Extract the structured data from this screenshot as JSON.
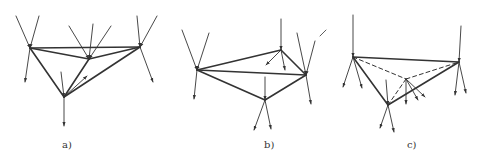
{
  "figure": {
    "stroke_color": "#333333",
    "panels": [
      {
        "id": "a",
        "label": "a)",
        "label_pos": [
          62,
          149
        ],
        "nodes": {
          "A": [
            30,
            48
          ],
          "B": [
            89,
            59
          ],
          "C": [
            140,
            47
          ],
          "D": [
            64,
            97
          ]
        },
        "edges": [
          [
            "A",
            "C"
          ],
          [
            "A",
            "B"
          ],
          [
            "B",
            "C"
          ],
          [
            "A",
            "D"
          ],
          [
            "B",
            "D"
          ],
          [
            "C",
            "D"
          ]
        ],
        "dashed_edges": [],
        "arrows_in": [
          [
            [
              16,
              16
            ],
            [
              30,
              48
            ]
          ],
          [
            [
              39,
              16
            ],
            [
              30,
              48
            ]
          ],
          [
            [
              69,
              26
            ],
            [
              89,
              59
            ]
          ],
          [
            [
              93,
              24
            ],
            [
              89,
              59
            ]
          ],
          [
            [
              111,
              26
            ],
            [
              89,
              59
            ]
          ],
          [
            [
              137,
              16
            ],
            [
              140,
              47
            ]
          ],
          [
            [
              157,
              16
            ],
            [
              140,
              47
            ]
          ],
          [
            [
              61,
              72
            ],
            [
              64,
              97
            ]
          ]
        ],
        "arrows_out": [
          [
            [
              30,
              48
            ],
            [
              25,
              82
            ]
          ],
          [
            [
              140,
              47
            ],
            [
              153,
              82
            ]
          ],
          [
            [
              64,
              97
            ],
            [
              64,
              126
            ]
          ],
          [
            [
              64,
              97
            ],
            [
              87,
              76
            ]
          ]
        ]
      },
      {
        "id": "b",
        "label": "b)",
        "label_pos": [
          264,
          149
        ],
        "nodes": {
          "A": [
            197,
            70
          ],
          "B": [
            281,
            50
          ],
          "C": [
            306,
            75
          ],
          "D": [
            265,
            100
          ]
        },
        "edges": [
          [
            "A",
            "B"
          ],
          [
            "A",
            "C"
          ],
          [
            "B",
            "C"
          ],
          [
            "A",
            "D"
          ],
          [
            "C",
            "D"
          ]
        ],
        "dashed_edges": [],
        "arrows_in": [
          [
            [
              182,
              30
            ],
            [
              197,
              70
            ]
          ],
          [
            [
              209,
              33
            ],
            [
              197,
              70
            ]
          ],
          [
            [
              281,
              19
            ],
            [
              281,
              50
            ]
          ],
          [
            [
              297,
              33
            ],
            [
              306,
              75
            ]
          ],
          [
            [
              315,
              41
            ],
            [
              306,
              75
            ]
          ],
          [
            [
              265,
              77
            ],
            [
              265,
              100
            ]
          ]
        ],
        "arrows_out": [
          [
            [
              197,
              70
            ],
            [
              194,
              99
            ]
          ],
          [
            [
              281,
              50
            ],
            [
              266,
              65
            ]
          ],
          [
            [
              281,
              50
            ],
            [
              285,
              70
            ]
          ],
          [
            [
              306,
              75
            ],
            [
              311,
              104
            ]
          ],
          [
            [
              265,
              100
            ],
            [
              254,
              130
            ]
          ],
          [
            [
              265,
              100
            ],
            [
              271,
              129
            ]
          ]
        ]
      },
      {
        "id": "c",
        "label": "c)",
        "label_pos": [
          407,
          149
        ],
        "nodes": {
          "A": [
            353,
            57
          ],
          "B": [
            459,
            62
          ],
          "C": [
            406,
            79
          ],
          "D": [
            388,
            105
          ]
        },
        "edges": [
          [
            "A",
            "B"
          ],
          [
            "A",
            "D"
          ],
          [
            "B",
            "D"
          ]
        ],
        "dashed_edges": [
          [
            "A",
            "C"
          ],
          [
            "C",
            "B"
          ],
          [
            "C",
            "D"
          ]
        ],
        "arrows_in": [
          [
            [
              353,
              15
            ],
            [
              353,
              57
            ]
          ],
          [
            [
              461,
              26
            ],
            [
              459,
              62
            ]
          ],
          [
            [
              386,
              80
            ],
            [
              388,
              105
            ]
          ]
        ],
        "arrows_out": [
          [
            [
              353,
              57
            ],
            [
              343,
              87
            ]
          ],
          [
            [
              353,
              57
            ],
            [
              362,
              88
            ]
          ],
          [
            [
              406,
              79
            ],
            [
              406,
              104
            ]
          ],
          [
            [
              406,
              79
            ],
            [
              418,
              100
            ]
          ],
          [
            [
              406,
              79
            ],
            [
              425,
              97
            ]
          ],
          [
            [
              459,
              62
            ],
            [
              455,
              95
            ]
          ],
          [
            [
              459,
              62
            ],
            [
              466,
              93
            ]
          ],
          [
            [
              388,
              105
            ],
            [
              380,
              128
            ]
          ],
          [
            [
              388,
              105
            ],
            [
              394,
              132
            ]
          ]
        ],
        "stray_mark": [
          [
            320,
            36
          ],
          [
            326,
            30
          ]
        ]
      }
    ]
  }
}
